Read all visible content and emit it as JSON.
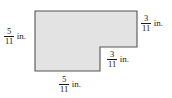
{
  "figure": {
    "type": "geometry-diagram",
    "shape": {
      "name": "l-shaped-polygon",
      "fill_color": "#e3e3e3",
      "stroke_color": "#555555",
      "vertices": [
        [
          35,
          11
        ],
        [
          137,
          11
        ],
        [
          137,
          47
        ],
        [
          100,
          47
        ],
        [
          100,
          71
        ],
        [
          35,
          71
        ]
      ]
    },
    "labels": {
      "left": {
        "numerator": "5",
        "denominator": "11",
        "unit": "in.",
        "side": "left-vertical"
      },
      "top_right": {
        "numerator": "3",
        "denominator": "11",
        "unit": "in.",
        "side": "right-upper-vertical"
      },
      "notch": {
        "numerator": "3",
        "denominator": "11",
        "unit": "in.",
        "side": "notch-horizontal"
      },
      "bottom": {
        "numerator": "5",
        "denominator": "11",
        "unit": "in.",
        "side": "bottom-horizontal"
      }
    }
  }
}
